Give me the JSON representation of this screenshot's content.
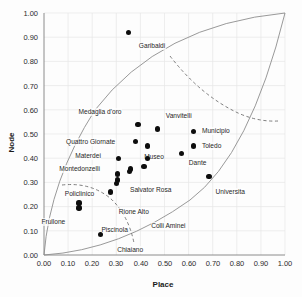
{
  "chart_data": {
    "type": "scatter",
    "title": "",
    "xlabel": "Place",
    "ylabel": "Node",
    "xlim": [
      0.0,
      1.0
    ],
    "ylim": [
      0.0,
      1.0
    ],
    "grid": true,
    "legend": "none",
    "xticks": [
      "0.00",
      "0.10",
      "0.20",
      "0.30",
      "0.40",
      "0.50",
      "0.60",
      "0.70",
      "0.80",
      "0.90",
      "1.00"
    ],
    "yticks": [
      "0.00",
      "0.10",
      "0.20",
      "0.30",
      "0.40",
      "0.50",
      "0.60",
      "0.70",
      "0.80",
      "0.90",
      "1.00"
    ],
    "points": [
      {
        "label": "Garibaldi",
        "x": 0.35,
        "y": 0.92,
        "label_dx": 10,
        "label_dy": 10
      },
      {
        "label": "Medaglia d'oro",
        "x": 0.39,
        "y": 0.54,
        "label_dx": -60,
        "label_dy": -16
      },
      {
        "label": "Vanvitelli",
        "x": 0.47,
        "y": 0.52,
        "label_dx": 8,
        "label_dy": -17
      },
      {
        "label": "Municipio",
        "x": 0.62,
        "y": 0.51,
        "label_dx": 8,
        "label_dy": -5
      },
      {
        "label": "Quattro Giornate",
        "x": 0.38,
        "y": 0.47,
        "label_dx": -70,
        "label_dy": -3
      },
      {
        "label": "Museo",
        "x": 0.43,
        "y": 0.45,
        "label_dx": -4,
        "label_dy": 7
      },
      {
        "label": "Toledo",
        "x": 0.62,
        "y": 0.45,
        "label_dx": 8,
        "label_dy": -4
      },
      {
        "label": "Materdei",
        "x": 0.31,
        "y": 0.4,
        "label_dx": -44,
        "label_dy": -6
      },
      {
        "label": "Dante",
        "x": 0.57,
        "y": 0.42,
        "label_dx": 7,
        "label_dy": 6
      },
      {
        "label": "Montedonzelli",
        "x": 0.36,
        "y": 0.355,
        "label_dx": -72,
        "label_dy": -4
      },
      {
        "label": "Salvator Rosa",
        "x": 0.305,
        "y": 0.335,
        "label_dx": 12,
        "label_dy": 12
      },
      {
        "label": "Policlinico",
        "x": 0.3,
        "y": 0.295,
        "label_dx": -52,
        "label_dy": 6
      },
      {
        "label": "Universita",
        "x": 0.685,
        "y": 0.325,
        "label_dx": 6,
        "label_dy": 12
      },
      {
        "label": "Rione Alto",
        "x": 0.275,
        "y": 0.26,
        "label_dx": 8,
        "label_dy": 16
      },
      {
        "label": "Frullone",
        "x": 0.145,
        "y": 0.215,
        "label_dx": -38,
        "label_dy": 15
      },
      {
        "label": "Piscinola",
        "x": 0.145,
        "y": 0.195,
        "label_dx": 22,
        "label_dy": 18
      },
      {
        "label": "Colli Aminei",
        "x": 0.235,
        "y": 0.085,
        "label_dx": 50,
        "label_dy": -12
      },
      {
        "label": "Chiaiano",
        "x": 0.235,
        "y": 0.085,
        "label_dx": 16,
        "label_dy": 12
      }
    ],
    "extra_points": [
      {
        "x": 0.43,
        "y": 0.4
      },
      {
        "x": 0.355,
        "y": 0.345
      },
      {
        "x": 0.415,
        "y": 0.365
      },
      {
        "x": 0.305,
        "y": 0.31
      }
    ],
    "boundary_curves": [
      {
        "name": "upper-arc"
      },
      {
        "name": "lower-arc"
      },
      {
        "name": "left-arc"
      },
      {
        "name": "right-arc"
      }
    ],
    "dashed_curves": [
      {
        "name": "upper-dashed-divider"
      },
      {
        "name": "lower-dashed-divider"
      }
    ]
  }
}
